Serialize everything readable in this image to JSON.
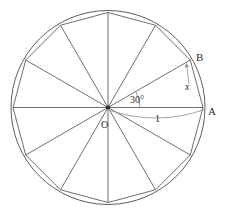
{
  "figure": {
    "type": "geometry-diagram",
    "circle": {
      "center_x": 108,
      "center_y": 107.5,
      "radius": 97,
      "stroke_color": "#4a4a4a"
    },
    "polygon": {
      "sides": 12,
      "name": "regular dodecagon",
      "start_angle_deg": 0,
      "step_angle_deg": 30,
      "stroke_color": "#4a4a4a"
    },
    "radii": {
      "count": 12,
      "stroke_color": "#4a4a4a"
    },
    "angle_arc": {
      "from_deg": 0,
      "to_deg": 30,
      "radius": 32,
      "stroke_color": "#7a7a7a"
    },
    "length_arc": {
      "stroke_color": "#8c8c8c"
    },
    "x_leader": {
      "stroke_color": "#8c8c8c"
    },
    "labels": {
      "center": "O",
      "point_a": "A",
      "point_b": "B",
      "angle": "30°",
      "radius_length": "1",
      "side_length": "x"
    }
  },
  "chart_data": {
    "type": "diagram",
    "annotations": [
      {
        "name": "O",
        "role": "circle-center",
        "x": 0,
        "y": 0
      },
      {
        "name": "A",
        "role": "vertex-at-0deg",
        "x": 1,
        "y": 0
      },
      {
        "name": "B",
        "role": "vertex-at-30deg",
        "x": 0.866,
        "y": 0.5
      },
      {
        "name": "30°",
        "role": "central-angle-AOB",
        "value": 30,
        "unit": "degrees"
      },
      {
        "name": "1",
        "role": "radius-OA-length",
        "value": 1
      },
      {
        "name": "x",
        "role": "side-length-AB",
        "value": null
      }
    ],
    "vertex_angles_deg": [
      0,
      30,
      60,
      90,
      120,
      150,
      180,
      210,
      240,
      270,
      300,
      330
    ]
  }
}
